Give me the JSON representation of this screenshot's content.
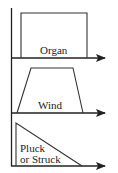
{
  "diagram": {
    "type": "envelope-shapes",
    "panels": [
      {
        "label": "Organ",
        "shape": "rectangle"
      },
      {
        "label": "Wind",
        "shape": "trapezoid"
      },
      {
        "label_line1": "Pluck",
        "label_line2": "or Struck",
        "shape": "right-triangle-decay"
      }
    ],
    "colors": {
      "stroke": "#222222",
      "background": "#ffffff"
    }
  }
}
